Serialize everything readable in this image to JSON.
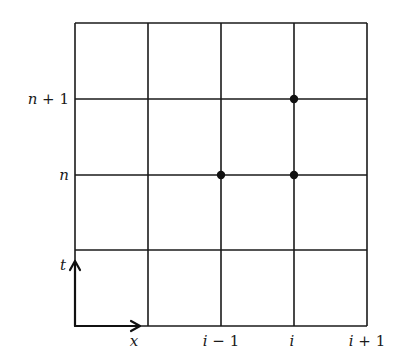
{
  "diagram": {
    "type": "finite-difference-grid",
    "grid": {
      "columns": 4,
      "rows": 4,
      "x_lines": [
        75,
        148,
        221,
        294,
        367
      ],
      "y_lines": [
        23,
        99,
        175,
        250,
        326
      ],
      "line_color": "#1a1a1a"
    },
    "row_labels": [
      {
        "text": "n + 1",
        "y": 99
      },
      {
        "text": "n",
        "y": 175
      }
    ],
    "column_labels": [
      {
        "text": "i − 1",
        "x": 221
      },
      {
        "text": "i",
        "x": 294
      },
      {
        "text": "i + 1",
        "x": 367
      }
    ],
    "axes": {
      "t_label": "t",
      "x_label": "x"
    },
    "nodes": [
      {
        "name": "node-i-minus-1-n",
        "x": 221,
        "y": 175
      },
      {
        "name": "node-i-n",
        "x": 294,
        "y": 175
      },
      {
        "name": "node-i-n-plus-1",
        "x": 294,
        "y": 99
      }
    ],
    "node_color": "#111111"
  }
}
